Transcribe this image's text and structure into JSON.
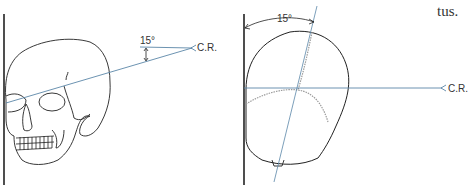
{
  "page_text": {
    "fragment": "tus."
  },
  "figures": [
    {
      "id": "left",
      "description": "Lateral view of skull against image receptor with central ray angled 15°",
      "angle_label": "15°",
      "ray_label": "C.R."
    },
    {
      "id": "right",
      "description": "Superior view of skull rotated 15° from receptor with horizontal central ray",
      "angle_label": "15°",
      "ray_label": "C.R."
    }
  ],
  "colors": {
    "line": "#222222",
    "ray": "#5b87a8",
    "suture": "#9a9a9a"
  }
}
